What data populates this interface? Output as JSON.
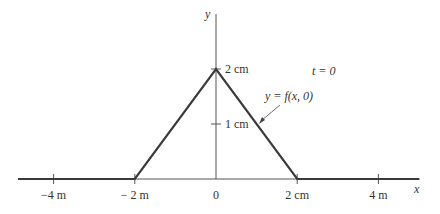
{
  "diagram": {
    "type": "wave-pulse-profile",
    "time_label": "t = 0",
    "curve_label": "y = f(x, 0)",
    "axes": {
      "x_label": "x",
      "y_label": "y",
      "x_ticks": [
        {
          "value": -4,
          "label": "−4 m"
        },
        {
          "value": -2,
          "label": "− 2 m"
        },
        {
          "value": 0,
          "label": "0"
        },
        {
          "value": 2,
          "label": "2 cm"
        },
        {
          "value": 4,
          "label": "4 m"
        }
      ],
      "y_ticks": [
        {
          "value": 1,
          "label": "1 cm"
        },
        {
          "value": 2,
          "label": "2 cm"
        }
      ]
    },
    "pulse": {
      "points": [
        [
          -5,
          0
        ],
        [
          -2,
          0
        ],
        [
          0,
          2
        ],
        [
          2,
          0
        ],
        [
          5,
          0
        ]
      ]
    },
    "colors": {
      "line": "#3a3a3a",
      "axis": "#555555",
      "text": "#333333"
    }
  }
}
